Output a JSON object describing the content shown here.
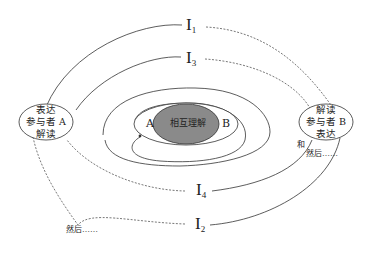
{
  "diagram": {
    "type": "communication-spiral",
    "center": {
      "label": "相互理解",
      "fill": "#888888"
    },
    "inner_labels": {
      "left": "A",
      "right": "B"
    },
    "participant_a": {
      "lines": [
        "表达",
        "参与者 A",
        "解读"
      ]
    },
    "participant_b": {
      "lines": [
        "解读",
        "参与者 B",
        "表达"
      ]
    },
    "interactions": [
      {
        "id": "I1",
        "base": "I",
        "sub": "1"
      },
      {
        "id": "I2",
        "base": "I",
        "sub": "2"
      },
      {
        "id": "I3",
        "base": "I",
        "sub": "3"
      },
      {
        "id": "I4",
        "base": "I",
        "sub": "4"
      }
    ],
    "annotations": {
      "and": "和",
      "then_right": "然后……",
      "then_left": "然后……"
    }
  }
}
